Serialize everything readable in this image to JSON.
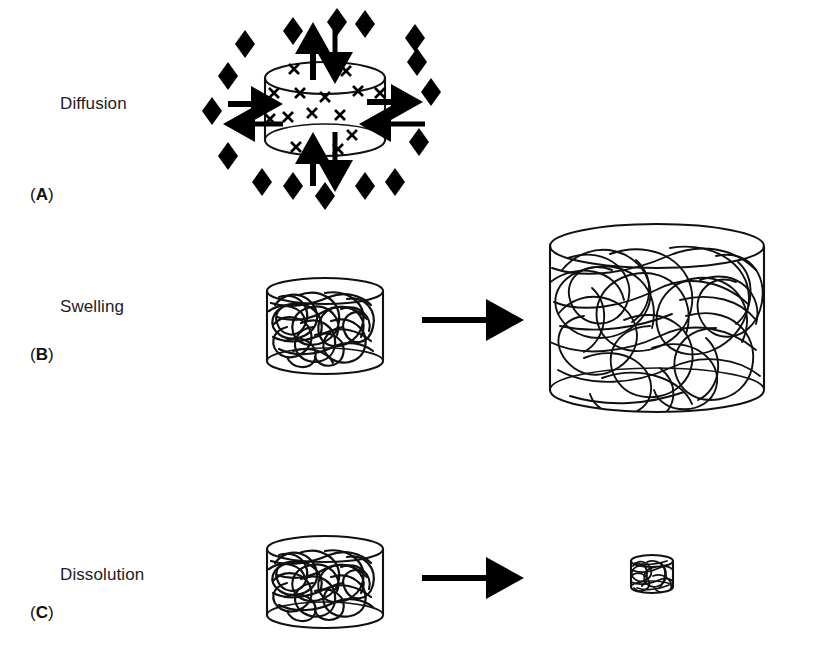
{
  "figure": {
    "width": 822,
    "height": 650,
    "background": "#ffffff",
    "ink_color": "#000000"
  },
  "panels": [
    {
      "letter": "(A)",
      "letter_bold_char": "A",
      "title": "Diffusion",
      "mechanism": "diffusion",
      "elements": {
        "matrix_shape": "cylinder",
        "drug_marker": "x",
        "drug_marker_count": 16,
        "medium_marker": "diamond",
        "medium_marker_count": 16,
        "arrow_count": 8,
        "arrow_directions": [
          "up",
          "down",
          "left",
          "right",
          "up",
          "down",
          "left",
          "right"
        ],
        "arrow_style": "bidirectional-solid"
      }
    },
    {
      "letter": "(B)",
      "letter_bold_char": "B",
      "title": "Swelling",
      "mechanism": "swelling",
      "elements": {
        "before_shape": "cylinder-small",
        "after_shape": "cylinder-large",
        "transition_arrow": "right",
        "network_pattern": "tangled-polymer-chains"
      }
    },
    {
      "letter": "(C)",
      "letter_bold_char": "C",
      "title": "Dissolution",
      "mechanism": "dissolution",
      "elements": {
        "before_shape": "cylinder-small",
        "after_shape": "cylinder-tiny",
        "transition_arrow": "right",
        "network_pattern": "tangled-polymer-chains"
      }
    }
  ],
  "labels": {
    "diffusion_title": "Diffusion",
    "diffusion_letter_open": "(",
    "diffusion_letter": "A",
    "diffusion_letter_close": ")",
    "swelling_title": "Swelling",
    "swelling_letter": "B",
    "dissolution_title": "Dissolution",
    "dissolution_letter": "C"
  }
}
